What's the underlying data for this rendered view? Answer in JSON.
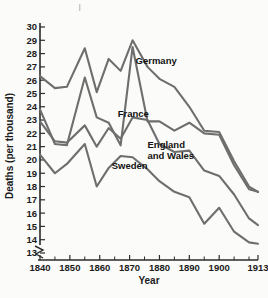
{
  "chart_data": {
    "type": "line",
    "title": "",
    "xlabel": "Year",
    "ylabel": "Deaths (per thousand)",
    "xlim": [
      1840,
      1913
    ],
    "ylim": [
      13,
      30
    ],
    "grid": false,
    "legend_position": "inline-labels",
    "y_axis_break": true,
    "x_tick_labels": [
      "1840",
      "1850",
      "1860",
      "1870",
      "1880",
      "1890",
      "1900",
      "1913"
    ],
    "x_tick_values": [
      1840,
      1850,
      1860,
      1870,
      1880,
      1890,
      1900,
      1913
    ],
    "x_minor_tick_values": [
      1845,
      1855,
      1865,
      1875,
      1885,
      1895,
      1905,
      1910
    ],
    "y_tick_labels": [
      "13",
      "14",
      "15",
      "16",
      "17",
      "18",
      "19",
      "20",
      "21",
      "22",
      "23",
      "24",
      "25",
      "26",
      "27",
      "28",
      "29",
      "30"
    ],
    "y_tick_values": [
      13,
      14,
      15,
      16,
      17,
      18,
      19,
      20,
      21,
      22,
      23,
      24,
      25,
      26,
      27,
      28,
      29,
      30
    ],
    "series": [
      {
        "name": "Germany",
        "label": "Germany",
        "label_x": 1872,
        "label_y": 27.2,
        "color": "#6e6e6e",
        "x": [
          1840,
          1845,
          1849,
          1855,
          1859,
          1863,
          1867,
          1871,
          1876,
          1880,
          1885,
          1890,
          1895,
          1900,
          1905,
          1910,
          1913
        ],
        "y": [
          26.3,
          25.4,
          25.5,
          28.4,
          25.1,
          27.6,
          26.7,
          29.0,
          27.0,
          26.1,
          25.5,
          24.0,
          22.2,
          22.1,
          19.9,
          18.0,
          17.6
        ]
      },
      {
        "name": "France",
        "label": "France",
        "label_x": 1866,
        "label_y": 23.2,
        "color": "#6e6e6e",
        "x": [
          1840,
          1845,
          1849,
          1855,
          1859,
          1863,
          1867,
          1871,
          1876,
          1880,
          1885,
          1890,
          1895,
          1900,
          1905,
          1910,
          1913
        ],
        "y": [
          23.8,
          21.2,
          21.1,
          26.2,
          23.2,
          22.8,
          21.1,
          28.5,
          22.9,
          22.9,
          22.2,
          22.8,
          22.0,
          21.9,
          19.6,
          17.8,
          17.6
        ]
      },
      {
        "name": "England and Wales",
        "label": "England and Wales",
        "label_line_1": "England",
        "label_line_2": "and Wales",
        "label_x": 1876,
        "label_y": 20.9,
        "color": "#6e6e6e",
        "x": [
          1840,
          1845,
          1849,
          1855,
          1859,
          1863,
          1867,
          1871,
          1876,
          1880,
          1885,
          1890,
          1895,
          1900,
          1905,
          1910,
          1913
        ],
        "y": [
          22.9,
          21.4,
          21.3,
          22.6,
          21.0,
          22.4,
          21.6,
          23.2,
          23.0,
          21.2,
          20.6,
          20.7,
          19.2,
          18.8,
          17.4,
          15.6,
          15.1
        ]
      },
      {
        "name": "Sweden",
        "label": "Sweden",
        "label_x": 1864,
        "label_y": 19.3,
        "color": "#6e6e6e",
        "x": [
          1840,
          1845,
          1849,
          1855,
          1859,
          1863,
          1867,
          1871,
          1876,
          1880,
          1885,
          1890,
          1895,
          1900,
          1905,
          1910,
          1913
        ],
        "y": [
          20.4,
          19.0,
          19.7,
          21.2,
          18.0,
          19.4,
          20.3,
          20.2,
          19.3,
          18.4,
          17.6,
          17.2,
          15.2,
          16.4,
          14.6,
          13.8,
          13.7
        ]
      }
    ]
  }
}
